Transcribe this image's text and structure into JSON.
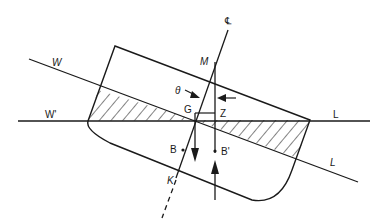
{
  "diagram": {
    "labels": {
      "centerline": "℄",
      "metacentre": "M",
      "angle": "θ",
      "gravity": "G",
      "z_point": "Z",
      "buoyancy": "B",
      "buoyancy_shifted": "B'",
      "keel": "K",
      "waterline_W": "W",
      "waterline_W_prime": "W'",
      "waterline_L_upper": "L",
      "waterline_L_lower": "L"
    },
    "colors": {
      "line": "#1a1a1a",
      "background": "#ffffff"
    }
  }
}
